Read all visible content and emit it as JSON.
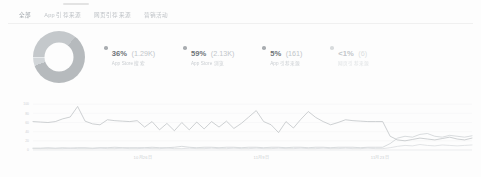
{
  "window": {
    "background": "#fdfdfd",
    "accent_color": "#9aa0a6"
  },
  "tabs": [
    {
      "id": "all",
      "label": "全部",
      "active": true
    },
    {
      "id": "app-referrers",
      "label": "App 引荐来源",
      "active": false
    },
    {
      "id": "web-referrers",
      "label": "网页引荐来源",
      "active": false
    },
    {
      "id": "campaigns",
      "label": "营销活动",
      "active": false
    }
  ],
  "donut": {
    "name": "referrer-breakdown-donut",
    "segments": [
      {
        "label": "App Store 搜索",
        "percent": 36,
        "count": "1.29K",
        "color": "#c4c8cb",
        "sweep": 36
      },
      {
        "label": "App Store 浏览",
        "percent": 59,
        "count": "2.13K",
        "color": "#b6babd",
        "sweep": 59
      },
      {
        "label": "App 引荐来源",
        "percent": 5,
        "count": "161",
        "color": "#d2d6d9",
        "sweep": 5
      },
      {
        "label": "网页引荐来源",
        "percent": 0.6,
        "count": "6",
        "color": "#e6e9eb",
        "sweep": 0.6
      }
    ]
  },
  "legend": [
    {
      "id": "legend-app-store-search",
      "percent_label": "36%",
      "count_label": "(1.29K)",
      "sub_label": "App Store 搜索",
      "dot_color": "#a9adb1",
      "muted": false
    },
    {
      "id": "legend-app-store-browse",
      "percent_label": "59%",
      "count_label": "(2.13K)",
      "sub_label": "App Store 浏览",
      "dot_color": "#a9adb1",
      "muted": false
    },
    {
      "id": "legend-app-referrers",
      "percent_label": "5%",
      "count_label": "(161)",
      "sub_label": "App 引荐来源",
      "dot_color": "#a9adb1",
      "muted": false
    },
    {
      "id": "legend-web-referrers",
      "percent_label": "<1%",
      "count_label": "(6)",
      "sub_label": "网页引荐来源",
      "dot_color": "#d8dbdd",
      "muted": true
    }
  ],
  "chart_data": {
    "type": "line",
    "title": "",
    "xlabel": "",
    "ylabel": "",
    "grid": true,
    "legend_position": "none",
    "ylim": [
      0,
      120
    ],
    "yticks": [
      0,
      20,
      40,
      60,
      80,
      100
    ],
    "ytick_labels": [
      "0",
      "20",
      "40",
      "60",
      "80",
      "100"
    ],
    "xticks": [
      0.25,
      0.52,
      0.79
    ],
    "xtick_labels": [
      "10月26日",
      "11月9日",
      "11月23日"
    ],
    "series": [
      {
        "name": "App Store 浏览",
        "color": "#b9bdc0",
        "values": [
          62,
          61,
          60,
          62,
          68,
          72,
          95,
          63,
          57,
          55,
          66,
          64,
          63,
          62,
          64,
          50,
          62,
          44,
          58,
          42,
          60,
          44,
          61,
          46,
          62,
          50,
          63,
          47,
          58,
          72,
          86,
          62,
          55,
          38,
          62,
          48,
          67,
          84,
          71,
          62,
          55,
          60,
          66,
          64,
          63,
          62,
          62,
          62,
          30,
          22,
          20,
          23,
          26,
          24,
          22,
          25,
          28,
          24,
          22,
          26
        ]
      },
      {
        "name": "App Store 搜索",
        "color": "#c9cdd0",
        "values": [
          4,
          4,
          5,
          4,
          5,
          4,
          5,
          5,
          4,
          5,
          5,
          6,
          5,
          5,
          5,
          5,
          6,
          5,
          5,
          6,
          8,
          6,
          5,
          6,
          6,
          5,
          6,
          6,
          5,
          6,
          6,
          5,
          6,
          6,
          5,
          6,
          6,
          5,
          6,
          6,
          5,
          6,
          6,
          6,
          5,
          6,
          6,
          6,
          14,
          26,
          30,
          28,
          34,
          36,
          30,
          28,
          32,
          30,
          28,
          31
        ]
      },
      {
        "name": "App 引荐来源",
        "color": "#d6d9db",
        "values": [
          3,
          3,
          3,
          3,
          3,
          4,
          3,
          3,
          3,
          4,
          3,
          3,
          4,
          3,
          3,
          4,
          3,
          3,
          4,
          3,
          3,
          4,
          3,
          3,
          4,
          3,
          3,
          4,
          3,
          3,
          4,
          3,
          3,
          4,
          3,
          3,
          4,
          3,
          3,
          4,
          3,
          3,
          4,
          3,
          3,
          4,
          3,
          3,
          5,
          8,
          10,
          9,
          12,
          10,
          9,
          11,
          10,
          9,
          10,
          11
        ]
      }
    ]
  }
}
